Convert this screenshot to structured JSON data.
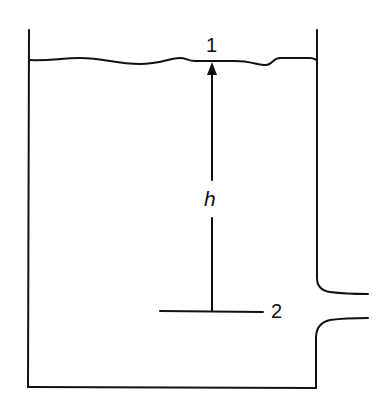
{
  "diagram": {
    "type": "tank-with-orifice",
    "labels": {
      "surface_point": "1",
      "outlet_point": "2",
      "head": "h"
    },
    "colors": {
      "stroke": "#111111",
      "background": "#ffffff"
    }
  }
}
